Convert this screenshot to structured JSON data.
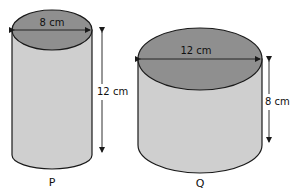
{
  "figure": {
    "colors": {
      "top": "#8f8f8f",
      "body": "#cfcfcf",
      "stroke": "#1a1a1a",
      "background": "#ffffff"
    },
    "cylinders": [
      {
        "id": "P",
        "label": "P",
        "diameter_label": "8 cm",
        "height_label": "12 cm",
        "diameter_cm": 8,
        "height_cm": 12
      },
      {
        "id": "Q",
        "label": "Q",
        "diameter_label": "12 cm",
        "height_label": "8 cm",
        "diameter_cm": 12,
        "height_cm": 8
      }
    ]
  }
}
